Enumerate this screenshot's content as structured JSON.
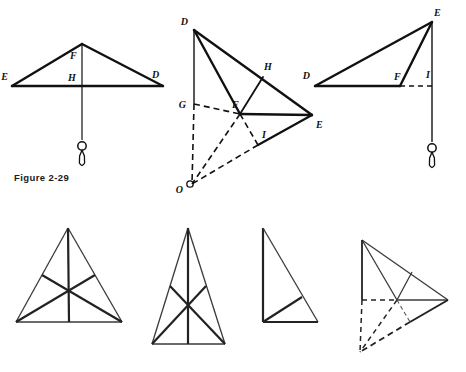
{
  "page": {
    "background_color": "#ffffff",
    "ink_color": "#111111",
    "width": 466,
    "height": 372
  },
  "caption": {
    "text": "Figure 2-29"
  },
  "top_row": {
    "front_view": {
      "name": "front-view-triangle-with-plumb-bob",
      "vertices": {
        "apex": [
          82,
          44
        ],
        "E": [
          12,
          86
        ],
        "D": [
          163,
          86
        ]
      },
      "labels": [
        {
          "text": "E",
          "x": 8,
          "y": 80
        },
        {
          "text": "D",
          "x": 152,
          "y": 78
        },
        {
          "text": "F",
          "x": 72,
          "y": 57
        },
        {
          "text": "H",
          "x": 70,
          "y": 79
        }
      ],
      "plumb_line": {
        "x": 82,
        "y_top": 44,
        "y_bottom": 138
      },
      "plumb_bob": {
        "cx": 82,
        "cy": 148
      }
    },
    "pictorial_view": {
      "name": "pictorial-oblique-view",
      "vertices": {
        "D": [
          194,
          30
        ],
        "G": [
          194,
          104
        ],
        "F": [
          240,
          114
        ],
        "E": [
          312,
          115
        ],
        "H": [
          263,
          77
        ],
        "I": [
          258,
          137
        ],
        "O": [
          192,
          184
        ]
      },
      "labels": [
        {
          "text": "D",
          "x": 190,
          "y": 24
        },
        {
          "text": "G",
          "x": 180,
          "y": 112
        },
        {
          "text": "H",
          "x": 265,
          "y": 72
        },
        {
          "text": "F",
          "x": 238,
          "y": 107
        },
        {
          "text": "E",
          "x": 315,
          "y": 128
        },
        {
          "text": "I",
          "x": 262,
          "y": 133
        },
        {
          "text": "O",
          "x": 185,
          "y": 192
        }
      ]
    },
    "side_view": {
      "name": "side-view-triangle-with-plumb-bob",
      "vertices": {
        "E": [
          432,
          22
        ],
        "D": [
          315,
          86
        ],
        "F": [
          400,
          86
        ],
        "I": [
          432,
          86
        ]
      },
      "labels": [
        {
          "text": "E",
          "x": 430,
          "y": 16
        },
        {
          "text": "D",
          "x": 308,
          "y": 78
        },
        {
          "text": "F",
          "x": 396,
          "y": 79
        },
        {
          "text": "I",
          "x": 427,
          "y": 77
        }
      ],
      "plumb_line": {
        "x": 432,
        "y_top": 22,
        "y_bottom": 140
      },
      "plumb_bob": {
        "cx": 432,
        "cy": 150
      }
    }
  },
  "bottom_row": {
    "triangle_a": {
      "name": "equilateral-triangle-with-medians",
      "vertices": {
        "apex": [
          68,
          228
        ],
        "left": [
          16,
          322
        ],
        "right": [
          122,
          322
        ]
      },
      "midpoints": {
        "left_side": [
          42,
          275
        ],
        "right_side": [
          95,
          275
        ],
        "base": [
          69,
          322
        ]
      },
      "centroid": [
        69,
        291
      ]
    },
    "triangle_b": {
      "name": "narrow-tall-triangle-with-medians",
      "vertices": {
        "apex": [
          188,
          228
        ],
        "left": [
          152,
          344
        ],
        "right": [
          225,
          344
        ]
      },
      "midpoints": {
        "left_side": [
          170,
          286
        ],
        "right_side": [
          206,
          286
        ],
        "base": [
          188,
          344
        ]
      },
      "centroid": [
        188,
        305
      ]
    },
    "triangle_c": {
      "name": "right-triangle-with-cevian",
      "vertices": {
        "top": [
          263,
          228
        ],
        "bottom_left": [
          263,
          322
        ],
        "bottom_right": [
          318,
          322
        ]
      },
      "cevian": {
        "from": [
          263,
          322
        ],
        "to": [
          302,
          297
        ]
      }
    },
    "triangle_d": {
      "name": "pictorial-triangle-with-hidden-lines",
      "vertices": {
        "D": [
          362,
          240
        ],
        "G": [
          362,
          300
        ],
        "F": [
          397,
          300
        ],
        "E": [
          448,
          300
        ],
        "H": [
          412,
          272
        ],
        "I": [
          410,
          318
        ],
        "O": [
          360,
          352
        ]
      }
    }
  },
  "icons": {
    "plumb_bob": "plumb-bob-icon"
  }
}
